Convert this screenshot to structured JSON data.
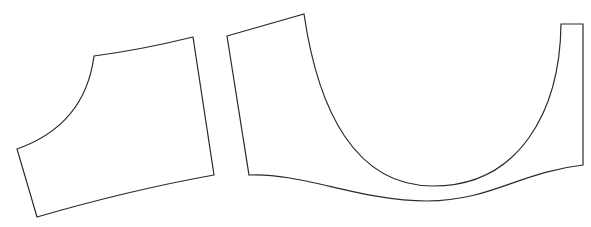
{
  "diagram": {
    "type": "sewing-pattern-pieces",
    "background": "#ffffff",
    "stroke_color": "#2a2a2a",
    "pieces": [
      {
        "name": "sleeve-piece",
        "shape": "quadrilateral with concave curved armhole edge"
      },
      {
        "name": "bodice-piece",
        "shape": "U-shaped piece with deep curved neckline and wavy bottom edge"
      }
    ]
  }
}
